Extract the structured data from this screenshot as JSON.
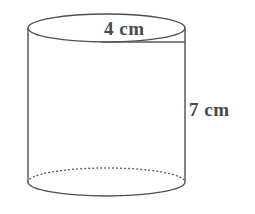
{
  "figure": {
    "name": "cylinder-diagram",
    "shape": "cylinder",
    "background_color": "#ffffff",
    "stroke_color": "#4f4f52",
    "label_color": "#4a4a4a"
  },
  "labels": {
    "diameter": "4 cm",
    "height": "7 cm"
  },
  "measurements": {
    "diameter_value": 4,
    "diameter_unit": "cm",
    "height_value": 7,
    "height_unit": "cm"
  },
  "geometry": {
    "top_ellipse": {
      "cx": 106.5,
      "cy": 28,
      "rx": 78.5,
      "ry": 14
    },
    "bottom_ellipse": {
      "cx": 106.5,
      "cy": 182,
      "rx": 78.5,
      "ry": 14
    },
    "left_side": {
      "x": 28,
      "y1": 28,
      "y2": 182
    },
    "right_side": {
      "x": 185,
      "y1": 28,
      "y2": 182
    },
    "diameter_line": {
      "x1": 101,
      "y1": 42,
      "x2": 185,
      "y2": 42
    }
  }
}
